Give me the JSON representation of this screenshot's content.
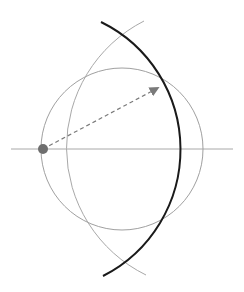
{
  "diagram": {
    "type": "geometric-construction",
    "background": "#ffffff",
    "elements": {
      "axis_line": {
        "x1": 11,
        "y1": 149,
        "x2": 233,
        "y2": 149,
        "color": "#a8a8a8",
        "width": 1
      },
      "circle": {
        "cx": 122,
        "cy": 149,
        "r": 81,
        "color": "#a0a0a0",
        "width": 1
      },
      "gray_arc": {
        "start": [
          144,
          21
        ],
        "end": [
          146,
          275
        ],
        "r": 142,
        "color": "#a8a8a8",
        "width": 1
      },
      "dark_arc": {
        "start": [
          101,
          22
        ],
        "end": [
          103,
          276
        ],
        "r": 142,
        "color": "#1a1a1a",
        "width": 2
      },
      "vector": {
        "from": [
          43,
          149
        ],
        "to": [
          162,
          86
        ],
        "color": "#7a7a7a",
        "dash": "4,3",
        "width": 1.2
      },
      "point": {
        "cx": 43,
        "cy": 149,
        "r": 5,
        "color": "#6e6e6e"
      }
    }
  }
}
